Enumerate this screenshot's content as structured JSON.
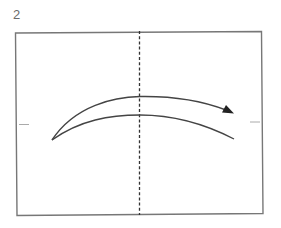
{
  "step": {
    "number": "2"
  },
  "diagram": {
    "type": "origami-fold-instruction",
    "paper": {
      "shape": "rectangle",
      "stroke": "#777777"
    },
    "center_line": {
      "style": "dashed",
      "meaning": "valley-fold-line",
      "stroke": "#333333"
    },
    "edge_marks": {
      "left": "tick",
      "right": "tick",
      "stroke": "#999999"
    },
    "arrow": {
      "meaning": "fold-left-to-right",
      "direction": "right",
      "stroke": "#444444"
    }
  }
}
